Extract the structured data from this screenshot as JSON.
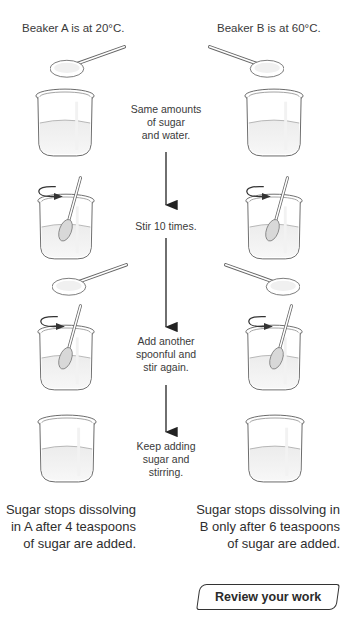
{
  "labels": {
    "beaker_a": "Beaker A is at 20°C.",
    "beaker_b": "Beaker B is at 60°C."
  },
  "steps": [
    {
      "text_lines": [
        "Same amounts",
        "of sugar",
        "and water."
      ]
    },
    {
      "text_lines": [
        "Stir 10 times."
      ]
    },
    {
      "text_lines": [
        "Add another",
        "spoonful and",
        "stir again."
      ]
    },
    {
      "text_lines": [
        "Keep adding",
        "sugar and",
        "stirring."
      ]
    }
  ],
  "conclusions": {
    "a_lines": [
      "Sugar stops dissolving",
      "in A after 4 teaspoons",
      "of sugar are added."
    ],
    "b_lines": [
      "Sugar stops dissolving in",
      "B only after 6 teaspoons",
      "of sugar are added."
    ]
  },
  "button": {
    "review_label": "Review your work"
  },
  "colors": {
    "outline": "#555555",
    "liquid": "#e8e8e8",
    "arrow": "#222222"
  }
}
